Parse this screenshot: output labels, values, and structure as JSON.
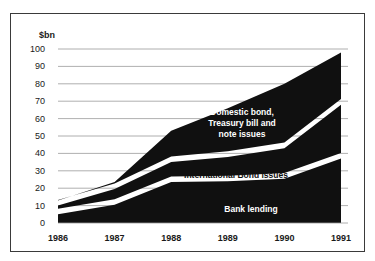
{
  "chart_data": {
    "type": "area",
    "title": "",
    "subtitle": "",
    "xlabel": "",
    "ylabel": "$bn",
    "unit_label": "$bn",
    "stacked": true,
    "grid": true,
    "legend_position": "inline-annotations",
    "categories": [
      "1986",
      "1987",
      "1988",
      "1989",
      "1990",
      "1991"
    ],
    "x": [
      1986,
      1987,
      1988,
      1989,
      1990,
      1991
    ],
    "xlim": [
      1986,
      1991
    ],
    "ylim": [
      0,
      100
    ],
    "yticks": [
      0,
      10,
      20,
      30,
      40,
      50,
      60,
      70,
      80,
      90,
      100
    ],
    "ytick_labels": [
      "0",
      "10",
      "20",
      "30",
      "40",
      "50",
      "60",
      "70",
      "80",
      "90",
      "100"
    ],
    "series": [
      {
        "name": "Bank lending",
        "label": "Bank lending",
        "color": "#101010",
        "values": [
          5,
          10.5,
          23.5,
          24,
          25.5,
          37
        ],
        "cumulative_top": [
          5,
          10.5,
          23.5,
          24,
          25.5,
          37
        ]
      },
      {
        "name": "International Bond issues",
        "label": "International Bond issues",
        "color": "#101010",
        "values": [
          5,
          9,
          11.5,
          14,
          17.5,
          31
        ],
        "cumulative_top": [
          10,
          19.5,
          35,
          38,
          43,
          68
        ]
      },
      {
        "name": "Domestic bond, Treasury bill and note issues",
        "label": "Domestic bond,\nTreasury bill and\nnote issues",
        "color": "#101010",
        "values": [
          3,
          4,
          18,
          28,
          37,
          30
        ],
        "cumulative_top": [
          13,
          23.5,
          53,
          66,
          80,
          98
        ]
      }
    ],
    "annotations": [
      {
        "name": "domestic-bond-label",
        "text": "Domestic bond,\nTreasury bill and\nnote issues",
        "text_color": "#ffffff"
      },
      {
        "name": "international-bond-label",
        "text": "International Bond issues",
        "text_color": "#111111"
      },
      {
        "name": "bank-lending-label",
        "text": "Bank lending",
        "text_color": "#ffffff"
      }
    ],
    "colors": {
      "area_fill": "#101010",
      "gap_fill": "#ffffff",
      "gridline": "#9a9a9a",
      "frame_border": "#3a3a3a",
      "background": "#ffffff",
      "text": "#1a1a1a"
    }
  }
}
